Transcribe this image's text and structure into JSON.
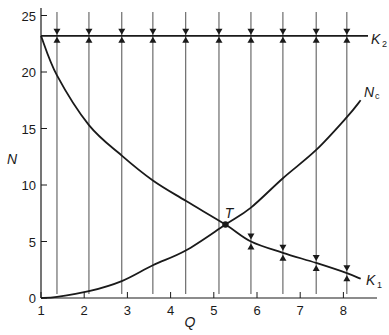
{
  "chart_data": {
    "type": "line",
    "title": "",
    "xlabel": "Q",
    "ylabel": "N",
    "xlim": [
      1,
      8.8
    ],
    "ylim": [
      0,
      26
    ],
    "x_ticks": [
      1,
      2,
      3,
      4,
      5,
      6,
      7,
      8
    ],
    "y_ticks": [
      0,
      5,
      10,
      15,
      20,
      25
    ],
    "grid": false,
    "legend": "none (inline curve labels)",
    "series": [
      {
        "name": "K2",
        "label": "K",
        "subscript": "2",
        "x": [
          1,
          8.8
        ],
        "y": [
          23.2,
          23.2
        ]
      },
      {
        "name": "K1",
        "label": "K",
        "subscript": "1",
        "x": [
          1,
          1.37,
          2.11,
          2.87,
          3.59,
          4.35,
          5.27,
          5.86,
          6.6,
          7.37,
          8.08,
          8.4
        ],
        "y": [
          23.2,
          19.7,
          15.3,
          12.6,
          10.4,
          8.6,
          6.5,
          5.0,
          4.0,
          3.1,
          2.2,
          1.7
        ]
      },
      {
        "name": "Nc",
        "label": "N",
        "subscript": "c",
        "x": [
          1,
          1.37,
          2.11,
          2.87,
          3.59,
          4.35,
          5.27,
          5.86,
          6.6,
          7.37,
          8.08,
          8.4
        ],
        "y": [
          0,
          0.1,
          0.6,
          1.5,
          2.9,
          4.2,
          6.5,
          8.0,
          10.6,
          13.1,
          16.0,
          17.5
        ]
      }
    ],
    "trajectories": {
      "description": "vertical lines with arrows converging onto K2 from above and below; on lines right of T, arrows also converge onto K1",
      "x": [
        1.37,
        2.11,
        2.87,
        3.59,
        4.35,
        5.12,
        5.86,
        6.6,
        7.37,
        8.08
      ]
    },
    "annotations": [
      {
        "text": "T",
        "x": 5.27,
        "y": 6.5,
        "marker": "filled-circle"
      }
    ]
  },
  "labels": {
    "x_axis": "Q",
    "y_axis": "N",
    "point": "T",
    "k2_main": "K",
    "k2_sub": "2",
    "k1_main": "K",
    "k1_sub": "1",
    "nc_main": "N",
    "nc_sub": "c"
  },
  "colors": {
    "ink": "#1a1a1a",
    "thin_line": "#3a3a3a",
    "background": "#ffffff"
  }
}
